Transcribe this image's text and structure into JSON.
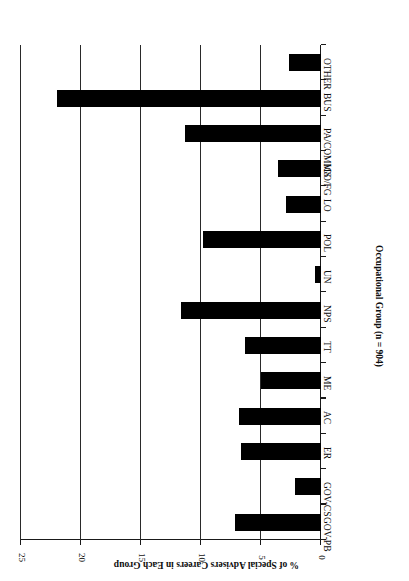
{
  "chart_data": {
    "type": "bar",
    "orientation": "horizontal",
    "title": "",
    "xlabel": "Occupational Group (n = 904)",
    "ylabel": "% of Special Advisers Careers in Each Group",
    "categories": [
      "GOV-PB",
      "GOV-CS",
      "ER",
      "AC",
      "ME",
      "TT",
      "NPS",
      "UN",
      "POL",
      "LO",
      "IGO/FG",
      "PA/COMMS",
      "BUS",
      "OTHER"
    ],
    "values": [
      7.2,
      2.2,
      6.7,
      6.8,
      5.0,
      6.3,
      11.7,
      0.5,
      9.8,
      2.9,
      3.6,
      11.3,
      22.0,
      2.7
    ],
    "ylim": [
      0,
      25
    ],
    "tick_labels": [
      "0",
      "5",
      "10",
      "15",
      "20",
      "25"
    ],
    "tick_values": [
      0,
      5,
      10,
      15,
      20,
      25
    ],
    "grid": true,
    "legend": "none",
    "bar_color": "#000000",
    "axis_color": "#1a1a1a",
    "background": "#ffffff",
    "rotated_180": true
  },
  "axes": {
    "value_axis_title": "% of Special Advisers Careers in Each Group",
    "category_axis_title": "Occupational Group (n = 904)"
  }
}
